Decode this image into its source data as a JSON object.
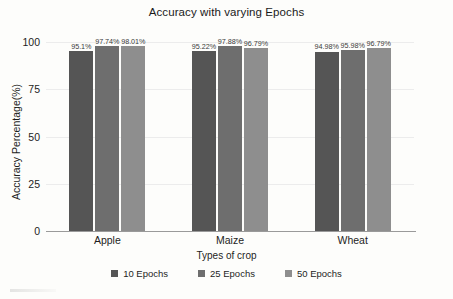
{
  "chart_data": {
    "type": "bar",
    "title": "Accuracy with varying Epochs",
    "xlabel": "Types of crop",
    "ylabel": "Accuracy Percentage(%)",
    "categories": [
      "Apple",
      "Maize",
      "Wheat"
    ],
    "ylim": [
      0,
      100
    ],
    "yticks": [
      "0",
      "25",
      "50",
      "75",
      "100"
    ],
    "grid": true,
    "legend_position": "bottom",
    "series": [
      {
        "name": "10 Epochs",
        "color": "#555555",
        "values": [
          95.1,
          95.22,
          94.98
        ],
        "labels": [
          "95.1%",
          "95.22%",
          "94.98%"
        ]
      },
      {
        "name": "25 Epochs",
        "color": "#6e6e6e",
        "values": [
          97.74,
          97.88,
          95.98
        ],
        "labels": [
          "97.74%",
          "97.88%",
          "95.98%"
        ]
      },
      {
        "name": "50 Epochs",
        "color": "#8e8e8e",
        "values": [
          98.01,
          96.79,
          96.79
        ],
        "labels": [
          "98.01%",
          "96.79%",
          "96.79%"
        ]
      }
    ]
  }
}
